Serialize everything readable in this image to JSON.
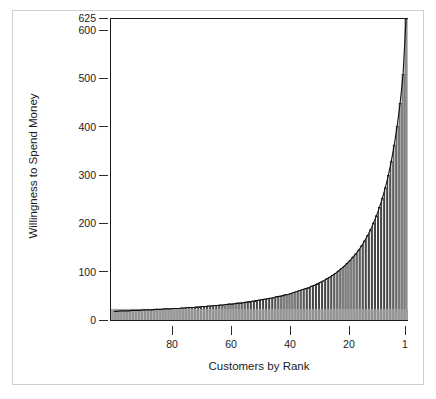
{
  "chart_data": {
    "type": "bar",
    "title": "",
    "subtitle": "",
    "xlabel": "Customers by Rank",
    "ylabel": "Willingness to Spend Money",
    "grid": false,
    "legend": null,
    "xlim": [
      100,
      1
    ],
    "ylim": [
      0,
      625
    ],
    "x_axis_direction": "descending",
    "yticks": [
      0,
      100,
      200,
      300,
      400,
      500,
      600,
      625
    ],
    "ytick_labels": [
      "0",
      "100",
      "200",
      "300",
      "400",
      "500",
      "600",
      "625"
    ],
    "xticks": [
      80,
      60,
      40,
      20,
      1
    ],
    "xtick_labels": [
      "80",
      "60",
      "40",
      "20",
      "1"
    ],
    "bar_fill": "#ffffff",
    "bar_edge": "#1a1a1a",
    "shaded_band": {
      "label": "",
      "color": "#a8a8a8",
      "y_from": 0,
      "y_to": 25,
      "x_from": 100,
      "x_to": 1
    },
    "categories": [
      100,
      99,
      98,
      97,
      96,
      95,
      94,
      93,
      92,
      91,
      90,
      89,
      88,
      87,
      86,
      85,
      84,
      83,
      82,
      81,
      80,
      79,
      78,
      77,
      76,
      75,
      74,
      73,
      72,
      71,
      70,
      69,
      68,
      67,
      66,
      65,
      64,
      63,
      62,
      61,
      60,
      59,
      58,
      57,
      56,
      55,
      54,
      53,
      52,
      51,
      50,
      49,
      48,
      47,
      46,
      45,
      44,
      43,
      42,
      41,
      40,
      39,
      38,
      37,
      36,
      35,
      34,
      33,
      32,
      31,
      30,
      29,
      28,
      27,
      26,
      25,
      24,
      23,
      22,
      21,
      20,
      19,
      18,
      17,
      16,
      15,
      14,
      13,
      12,
      11,
      10,
      9,
      8,
      7,
      6,
      5,
      4,
      3,
      2,
      1
    ],
    "values": [
      20,
      20,
      21,
      21,
      21,
      21,
      22,
      22,
      22,
      22,
      23,
      23,
      23,
      23,
      24,
      24,
      24,
      25,
      25,
      25,
      26,
      26,
      26,
      27,
      27,
      28,
      28,
      28,
      29,
      29,
      30,
      30,
      31,
      31,
      32,
      32,
      33,
      33,
      34,
      35,
      35,
      36,
      37,
      37,
      38,
      39,
      40,
      41,
      42,
      43,
      44,
      45,
      46,
      47,
      48,
      50,
      51,
      52,
      54,
      55,
      57,
      59,
      61,
      63,
      65,
      67,
      69,
      72,
      74,
      77,
      80,
      83,
      87,
      90,
      94,
      98,
      103,
      108,
      113,
      119,
      125,
      132,
      139,
      147,
      156,
      166,
      177,
      189,
      203,
      218,
      235,
      254,
      276,
      301,
      330,
      364,
      403,
      450,
      510,
      625
    ],
    "bar_count": 100
  }
}
